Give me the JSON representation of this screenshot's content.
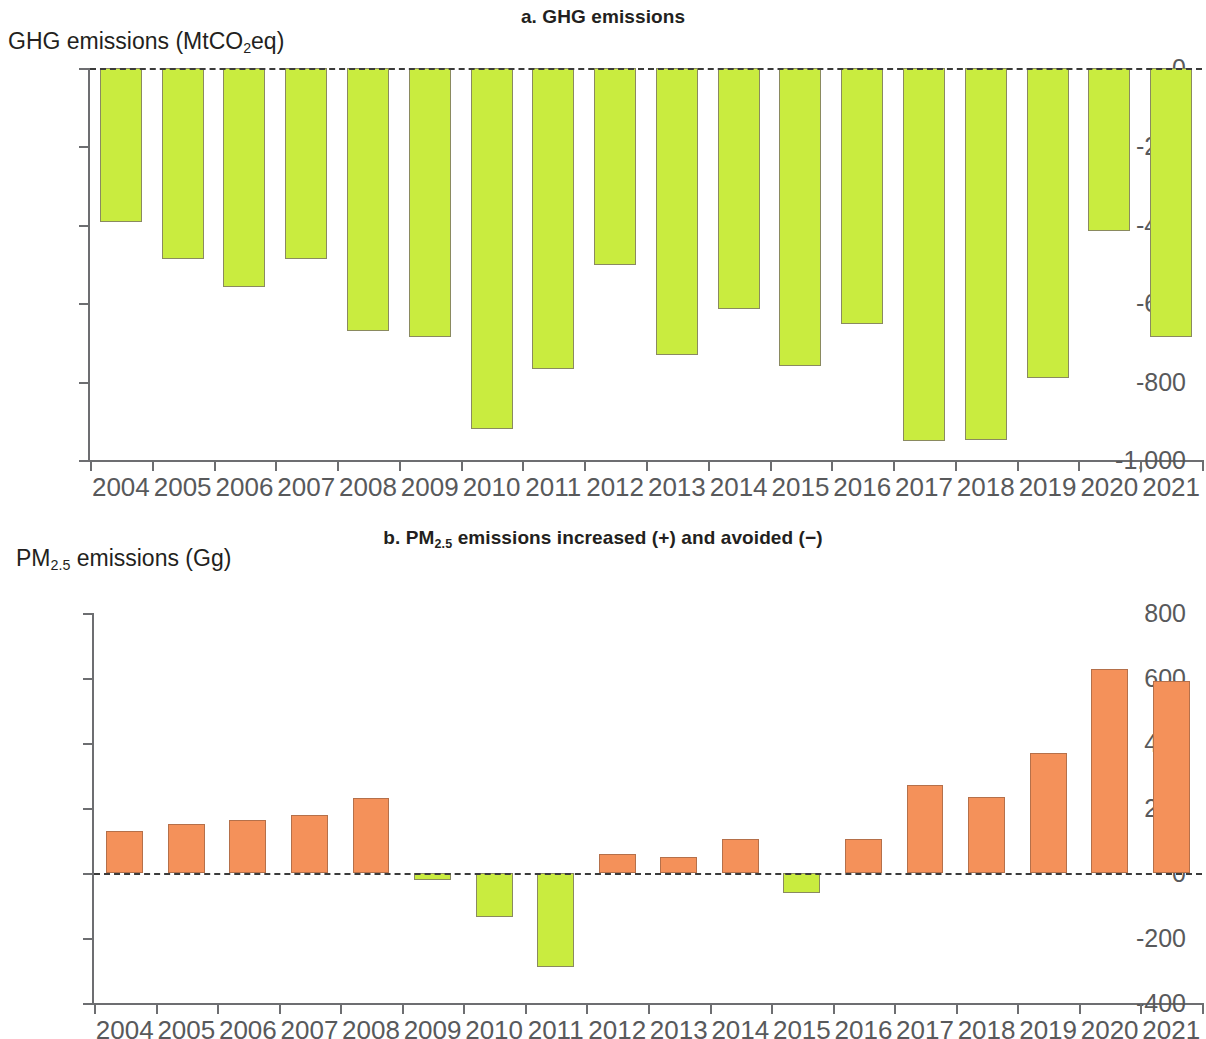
{
  "figure": {
    "panel_a_title_prefix": "a. ",
    "panel_a_title": "a. GHG emissions",
    "panel_b_title": "b. PM2.5 emissions increased (+) and avoided (−)",
    "panel_b_title_lead": "b. PM",
    "panel_b_title_sub": "2.5",
    "panel_b_title_tail": " emissions increased (+) and avoided (−)",
    "colors": {
      "green": "#c9ec3f",
      "green_border": "#8a8a60",
      "orange": "#f4915a",
      "orange_border": "#b5704a",
      "axis": "#6d6e71",
      "text": "#231f20",
      "tick_text": "#58595b"
    }
  },
  "chart_data": [
    {
      "type": "bar",
      "id": "a",
      "title": "a. GHG emissions",
      "ylabel_lead": "GHG emissions (MtCO",
      "ylabel_sub": "2",
      "ylabel_tail": "eq)",
      "ylabel": "GHG emissions (MtCO2eq)",
      "xlabel": "",
      "ylim": [
        -1000,
        0
      ],
      "yticks": [
        0,
        -200,
        -400,
        -600,
        -800,
        -1000
      ],
      "ytick_labels": [
        "0",
        "-200",
        "-400",
        "-600",
        "-800",
        "-1,000"
      ],
      "grid": false,
      "legend": "none",
      "zero_line": true,
      "bar_color": "#c9ec3f",
      "categories": [
        "2004",
        "2005",
        "2006",
        "2007",
        "2008",
        "2009",
        "2010",
        "2011",
        "2012",
        "2013",
        "2014",
        "2015",
        "2016",
        "2017",
        "2018",
        "2019",
        "2020",
        "2021"
      ],
      "values": [
        -393,
        -487,
        -558,
        -487,
        -670,
        -685,
        -920,
        -768,
        -502,
        -732,
        -616,
        -760,
        -652,
        -952,
        -950,
        -792,
        -415,
        -686
      ]
    },
    {
      "type": "bar",
      "id": "b",
      "title": "b. PM2.5 emissions increased (+) and avoided (−)",
      "ylabel_lead": "PM",
      "ylabel_sub": "2.5",
      "ylabel_tail": " emissions (Gg)",
      "ylabel": "PM2.5 emissions (Gg)",
      "xlabel": "",
      "ylim": [
        -400,
        800
      ],
      "yticks": [
        800,
        600,
        400,
        200,
        0,
        -200,
        -400
      ],
      "ytick_labels": [
        "800",
        "600",
        "400",
        "200",
        "0",
        "-200",
        "-400"
      ],
      "grid": false,
      "legend": "none",
      "zero_line": true,
      "positive_color": "#f4915a",
      "negative_color": "#c9ec3f",
      "categories": [
        "2004",
        "2005",
        "2006",
        "2007",
        "2008",
        "2009",
        "2010",
        "2011",
        "2012",
        "2013",
        "2014",
        "2015",
        "2016",
        "2017",
        "2018",
        "2019",
        "2020",
        "2021"
      ],
      "values": [
        128,
        150,
        162,
        178,
        232,
        -22,
        -135,
        -288,
        58,
        48,
        105,
        -62,
        104,
        272,
        235,
        368,
        628,
        592
      ]
    }
  ]
}
